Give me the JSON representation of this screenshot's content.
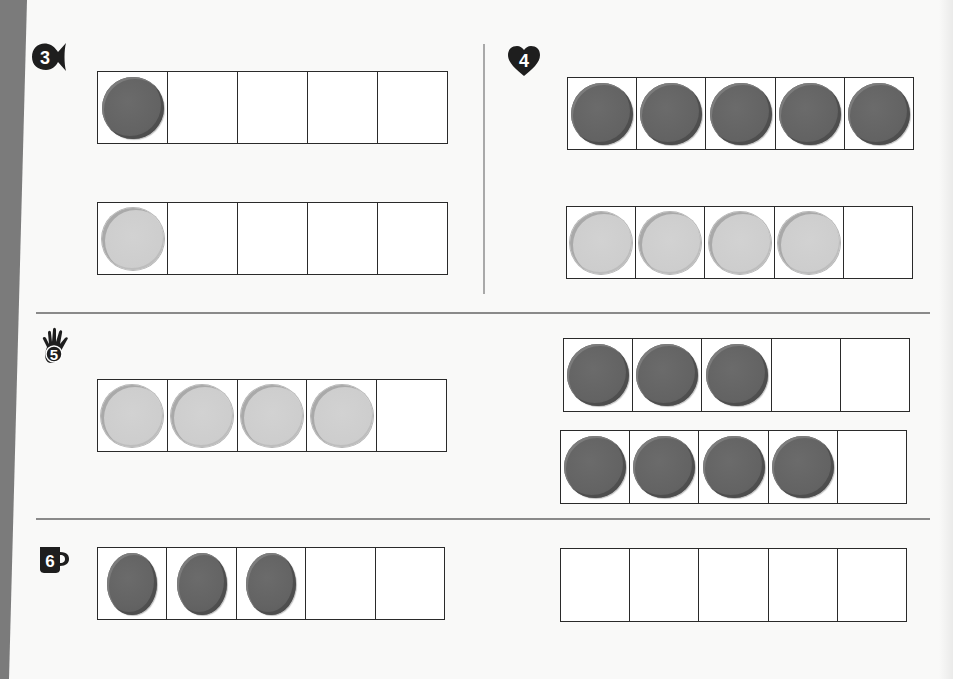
{
  "colors": {
    "side_band": "#7b7b7b",
    "dark_counter": "#636363",
    "light_counter": "#cdcdcd",
    "frame_border": "#2a2a2a",
    "separator": "#8a8a8a"
  },
  "sections": [
    {
      "number": "3",
      "icon": "fish-icon",
      "frames": [
        {
          "cells": 5,
          "filled": 1,
          "counter_color": "dark"
        },
        {
          "cells": 5,
          "filled": 1,
          "counter_color": "light"
        }
      ]
    },
    {
      "number": "4",
      "icon": "heart-icon",
      "frames": [
        {
          "cells": 5,
          "filled": 5,
          "counter_color": "dark"
        },
        {
          "cells": 5,
          "filled": 4,
          "counter_color": "light"
        }
      ]
    },
    {
      "number": "5",
      "icon": "hand-icon",
      "frames": [
        {
          "cells": 5,
          "filled": 4,
          "counter_color": "light"
        },
        {
          "cells": 5,
          "filled": 3,
          "counter_color": "dark"
        },
        {
          "cells": 5,
          "filled": 4,
          "counter_color": "dark"
        }
      ]
    },
    {
      "number": "6",
      "icon": "mug-icon",
      "frames": [
        {
          "cells": 5,
          "filled": 3,
          "counter_color": "dark"
        },
        {
          "cells": 5,
          "filled": 0,
          "counter_color": "none"
        }
      ]
    }
  ]
}
